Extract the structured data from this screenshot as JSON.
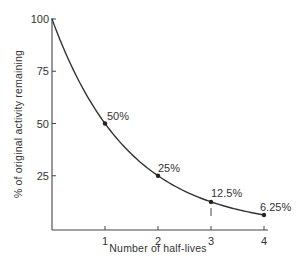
{
  "chart_data": {
    "type": "line",
    "title": "",
    "xlabel": "Number of half-lives",
    "ylabel": "% of original activity remaining",
    "x": [
      0,
      1,
      2,
      3,
      4
    ],
    "series": [
      {
        "name": "Activity remaining",
        "values": [
          100,
          50,
          25,
          12.5,
          6.25
        ]
      }
    ],
    "point_labels": [
      "50%",
      "25%",
      "12.5%",
      "6.25%"
    ],
    "x_ticks": [
      "1",
      "2",
      "3",
      "4"
    ],
    "y_ticks": [
      "100",
      "75",
      "50",
      "25"
    ],
    "xlim": [
      0,
      4.1
    ],
    "ylim": [
      0,
      100
    ],
    "grid": false,
    "legend": "none",
    "curve_color": "#333333"
  }
}
